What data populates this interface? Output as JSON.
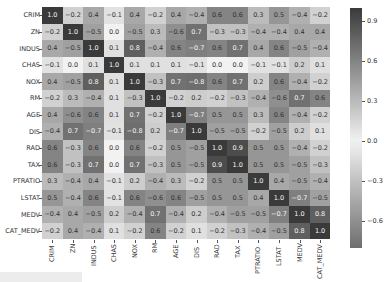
{
  "chart_data": {
    "type": "heatmap",
    "title": "",
    "xlabel": "",
    "ylabel": "",
    "labels": [
      "CRIM",
      "ZN",
      "INDUS",
      "CHAS",
      "NOX",
      "RM",
      "AGE",
      "DIS",
      "RAD",
      "TAX",
      "PTRATIO",
      "LSTAT",
      "MEDV",
      "CAT_MEDV"
    ],
    "matrix": [
      [
        1.0,
        -0.2,
        0.4,
        -0.1,
        0.4,
        -0.2,
        0.4,
        -0.4,
        0.6,
        0.6,
        0.3,
        0.5,
        -0.4,
        -0.2
      ],
      [
        -0.2,
        1.0,
        -0.5,
        -0.0,
        -0.5,
        0.3,
        -0.6,
        0.7,
        -0.3,
        -0.3,
        -0.4,
        -0.4,
        0.4,
        0.4
      ],
      [
        0.4,
        -0.5,
        1.0,
        0.1,
        0.8,
        -0.4,
        0.6,
        -0.7,
        0.6,
        0.7,
        0.4,
        0.6,
        -0.5,
        -0.4
      ],
      [
        -0.1,
        -0.0,
        0.1,
        1.0,
        0.1,
        0.1,
        0.1,
        -0.1,
        -0.0,
        -0.0,
        -0.1,
        -0.1,
        0.2,
        0.1
      ],
      [
        0.4,
        -0.5,
        0.8,
        0.1,
        1.0,
        -0.3,
        0.7,
        -0.8,
        0.6,
        0.7,
        0.2,
        0.6,
        -0.4,
        -0.2
      ],
      [
        -0.2,
        0.3,
        -0.4,
        0.1,
        -0.3,
        1.0,
        -0.2,
        0.2,
        -0.2,
        -0.3,
        -0.4,
        -0.6,
        0.7,
        0.6
      ],
      [
        0.4,
        -0.6,
        0.6,
        0.1,
        0.7,
        -0.2,
        1.0,
        -0.7,
        0.5,
        0.5,
        0.3,
        0.6,
        -0.4,
        -0.2
      ],
      [
        -0.4,
        0.7,
        -0.7,
        -0.1,
        -0.8,
        0.2,
        -0.7,
        1.0,
        -0.5,
        -0.5,
        -0.2,
        -0.5,
        0.2,
        0.1
      ],
      [
        0.6,
        -0.3,
        0.6,
        -0.0,
        0.6,
        -0.2,
        0.5,
        -0.5,
        1.0,
        0.9,
        0.5,
        0.5,
        -0.4,
        -0.2
      ],
      [
        0.6,
        -0.3,
        0.7,
        -0.0,
        0.7,
        -0.3,
        0.5,
        -0.5,
        0.9,
        1.0,
        0.5,
        0.5,
        -0.5,
        -0.3
      ],
      [
        0.3,
        -0.4,
        0.4,
        -0.1,
        0.2,
        -0.4,
        0.3,
        -0.2,
        0.5,
        0.5,
        1.0,
        0.4,
        -0.5,
        -0.4
      ],
      [
        0.5,
        -0.4,
        0.6,
        -0.1,
        0.6,
        -0.6,
        0.6,
        -0.5,
        0.5,
        0.5,
        0.4,
        1.0,
        -0.7,
        -0.5
      ],
      [
        -0.4,
        0.4,
        -0.5,
        0.2,
        -0.4,
        0.7,
        -0.4,
        0.2,
        -0.4,
        -0.5,
        -0.5,
        -0.7,
        1.0,
        0.8
      ],
      [
        -0.2,
        0.4,
        -0.4,
        0.1,
        -0.2,
        0.6,
        -0.2,
        0.1,
        -0.2,
        -0.3,
        -0.4,
        -0.5,
        0.8,
        1.0
      ]
    ],
    "annotations": true,
    "value_format": "0.1f",
    "colorbar": {
      "ticks": [
        0.9,
        0.6,
        0.3,
        0.0,
        -0.3,
        -0.6
      ],
      "tick_labels": [
        "0.9",
        "0.6",
        "0.3",
        "0.0",
        "−0.3",
        "−0.6"
      ],
      "range": [
        -0.8,
        1.0
      ]
    },
    "colors": {
      "low": "#6e6e6e",
      "mid": "#f2f2f2",
      "high": "#3a3a3a"
    },
    "grid": false,
    "legend_position": "right"
  }
}
